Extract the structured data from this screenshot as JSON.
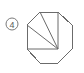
{
  "figure": {
    "label": {
      "number": "4",
      "style": "circled",
      "center_x": 12,
      "center_y": 24,
      "radius": 6
    },
    "stroke_color": "#6b6b6b",
    "label_color": "#5a5a5a",
    "background_color": "#ffffff",
    "canvas": {
      "width": 84,
      "height": 73
    }
  },
  "chart_data": {
    "type": "diagram",
    "title": "",
    "shape": "regular-octagon-with-chords",
    "polygon": {
      "name": "octagon",
      "vertex_count": 8,
      "points": "40,12 58,12 72,25 72,49 58,63 40,63 27,49 27,25",
      "vertices": [
        {
          "id": "A",
          "x": 40,
          "y": 12,
          "position": "top-left"
        },
        {
          "id": "B",
          "x": 58,
          "y": 12,
          "position": "top-right"
        },
        {
          "id": "C",
          "x": 72,
          "y": 25,
          "position": "right-top"
        },
        {
          "id": "D",
          "x": 72,
          "y": 49,
          "position": "right-bottom"
        },
        {
          "id": "E",
          "x": 58,
          "y": 63,
          "position": "bottom-right"
        },
        {
          "id": "F",
          "x": 40,
          "y": 63,
          "position": "bottom-left"
        },
        {
          "id": "G",
          "x": 27,
          "y": 49,
          "position": "left-bottom"
        },
        {
          "id": "H",
          "x": 27,
          "y": 25,
          "position": "left-top"
        }
      ]
    },
    "chords": [
      {
        "id": "chord-1",
        "from": "E",
        "to": "A",
        "x1": 58,
        "y1": 49,
        "x2": 40,
        "y2": 12
      },
      {
        "id": "chord-2",
        "from": "E",
        "to": "H",
        "x1": 58,
        "y1": 49,
        "x2": 27,
        "y2": 25
      },
      {
        "id": "chord-3",
        "from": "E",
        "to": "G",
        "x1": 58,
        "y1": 49,
        "x2": 27,
        "y2": 49
      },
      {
        "id": "chord-4",
        "from": "B",
        "to": "E",
        "x1": 58,
        "y1": 12,
        "x2": 58,
        "y2": 49
      }
    ],
    "hub_point": {
      "x": 58,
      "y": 49,
      "degree": 4
    },
    "grid": false,
    "legend": false
  }
}
